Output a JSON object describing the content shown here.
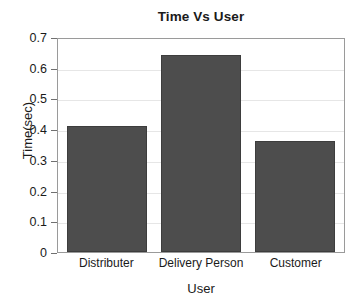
{
  "chart_data": {
    "type": "bar",
    "title": "Time Vs User",
    "xlabel": "User",
    "ylabel": "Time(sec)",
    "categories": [
      "Distributer",
      "Delivery Person",
      "Customer"
    ],
    "values": [
      0.41,
      0.64,
      0.36
    ],
    "ylim": [
      0,
      0.7
    ],
    "yticks": [
      0,
      0.1,
      0.2,
      0.3,
      0.4,
      0.5,
      0.6,
      0.7
    ],
    "ytick_labels": [
      "0",
      "0.1",
      "0.2",
      "0.3",
      "0.4",
      "0.5",
      "0.6",
      "0.7"
    ],
    "grid": true,
    "legend": null,
    "bar_color": "#4d4d4d",
    "bar_edge_color": "#3d3d3d",
    "axis_color": "#9a9a9a",
    "grid_color": "#e6e6e6",
    "text_color": "#1a1a1a",
    "background": "#ffffff"
  }
}
